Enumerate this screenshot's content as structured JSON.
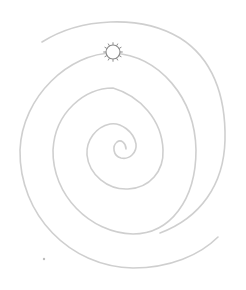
{
  "diagram": {
    "type": "archimedean-spiral",
    "background": "#ffffff",
    "spiral": {
      "color": "#cfcfcf",
      "center": [
        123,
        150
      ],
      "turns_description": "spiral winding outward from center to outer tail",
      "inner_end": [
        126,
        149
      ],
      "outer_start": [
        42,
        42
      ],
      "outer_end": [
        218,
        237
      ]
    },
    "marker": {
      "icon": "sun-icon",
      "position": [
        113,
        52
      ],
      "radius": 7,
      "stroke": "#8a8a8a",
      "rays": 12
    },
    "specks": [
      {
        "position": [
          44,
          259
        ]
      }
    ]
  }
}
